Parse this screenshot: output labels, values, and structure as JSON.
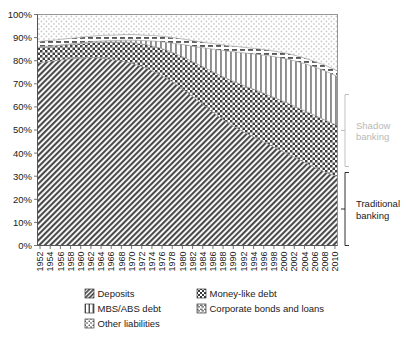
{
  "chart_data": {
    "type": "area",
    "title": "",
    "subtitle": "",
    "xlabel": "",
    "ylabel": "",
    "stacked": true,
    "normalized_percent": true,
    "grid": false,
    "legend_position": "bottom",
    "ylim": [
      0,
      100
    ],
    "ytick_labels": [
      "0%",
      "10%",
      "20%",
      "30%",
      "40%",
      "50%",
      "60%",
      "70%",
      "80%",
      "90%",
      "100%"
    ],
    "ytick_values": [
      0,
      10,
      20,
      30,
      40,
      50,
      60,
      70,
      80,
      90,
      100
    ],
    "xlim": [
      1952,
      2011
    ],
    "categories": [
      1952,
      1953,
      1954,
      1955,
      1956,
      1957,
      1958,
      1959,
      1960,
      1961,
      1962,
      1963,
      1964,
      1965,
      1966,
      1967,
      1968,
      1969,
      1970,
      1971,
      1972,
      1973,
      1974,
      1975,
      1976,
      1977,
      1978,
      1979,
      1980,
      1981,
      1982,
      1983,
      1984,
      1985,
      1986,
      1987,
      1988,
      1989,
      1990,
      1991,
      1992,
      1993,
      1994,
      1995,
      1996,
      1997,
      1998,
      1999,
      2000,
      2001,
      2002,
      2003,
      2004,
      2005,
      2006,
      2007,
      2008,
      2009,
      2010,
      2011
    ],
    "xtick_labels": [
      "1952",
      "1954",
      "1956",
      "1958",
      "1960",
      "1962",
      "1964",
      "1966",
      "1968",
      "1970",
      "1972",
      "1974",
      "1976",
      "1978",
      "1980",
      "1982",
      "1984",
      "1986",
      "1988",
      "1990",
      "1992",
      "1994",
      "1996",
      "1998",
      "2000",
      "2002",
      "2004",
      "2006",
      "2008",
      "2010"
    ],
    "series": [
      {
        "name": "Deposits",
        "pattern": "diagonal-hatch-dark",
        "color": "#5a5a5a",
        "values": [
          79.0,
          79.3,
          79.6,
          79.9,
          80.2,
          80.5,
          80.7,
          80.9,
          81.1,
          81.2,
          81.3,
          81.3,
          81.2,
          81.0,
          80.7,
          80.4,
          80.1,
          79.7,
          79.2,
          78.6,
          77.9,
          77.1,
          76.2,
          75.2,
          74.1,
          72.9,
          71.6,
          70.2,
          68.7,
          67.1,
          65.4,
          63.7,
          62.0,
          60.3,
          58.6,
          56.9,
          55.3,
          53.8,
          52.4,
          51.1,
          49.9,
          48.7,
          47.6,
          46.5,
          45.4,
          44.3,
          43.2,
          42.1,
          41.0,
          39.9,
          38.8,
          37.7,
          36.6,
          35.5,
          34.4,
          33.3,
          32.3,
          31.4,
          30.6,
          30.0
        ]
      },
      {
        "name": "Money-like debt",
        "pattern": "checker",
        "color": "#8a8a8a",
        "values": [
          6.6,
          6.6,
          6.5,
          6.4,
          6.3,
          6.2,
          6.2,
          6.2,
          6.2,
          6.3,
          6.4,
          6.6,
          6.8,
          7.1,
          7.4,
          7.7,
          8.0,
          8.4,
          8.8,
          9.2,
          9.6,
          10.0,
          10.5,
          11.0,
          11.5,
          12.0,
          12.5,
          13.0,
          13.6,
          14.2,
          14.8,
          15.4,
          16.0,
          16.6,
          17.2,
          17.8,
          18.3,
          18.8,
          19.2,
          19.6,
          19.9,
          20.2,
          20.5,
          20.8,
          21.0,
          21.2,
          21.4,
          21.6,
          21.8,
          22.0,
          22.1,
          22.2,
          22.3,
          22.4,
          22.5,
          22.6,
          22.6,
          22.5,
          22.3,
          22.0
        ]
      },
      {
        "name": "MBS/ABS debt",
        "pattern": "vertical-stripes",
        "color": "#9a9a9a",
        "values": [
          0.2,
          0.2,
          0.2,
          0.2,
          0.2,
          0.3,
          0.3,
          0.3,
          0.3,
          0.4,
          0.4,
          0.4,
          0.5,
          0.5,
          0.6,
          0.6,
          0.7,
          0.8,
          0.9,
          1.1,
          1.3,
          1.6,
          1.9,
          2.3,
          2.7,
          3.2,
          3.7,
          4.3,
          4.9,
          5.6,
          6.3,
          7.0,
          7.8,
          8.6,
          9.4,
          10.2,
          11.0,
          11.7,
          12.4,
          13.1,
          13.8,
          14.4,
          15.0,
          15.6,
          16.2,
          16.8,
          17.4,
          17.9,
          18.4,
          18.9,
          19.4,
          19.8,
          20.2,
          20.5,
          20.8,
          21.0,
          21.2,
          21.3,
          21.3,
          21.2
        ]
      },
      {
        "name": "Corporate bonds and loans",
        "pattern": "dashes",
        "color": "#707070",
        "values": [
          2.4,
          2.4,
          2.4,
          2.4,
          2.4,
          2.4,
          2.4,
          2.4,
          2.4,
          2.4,
          2.4,
          2.4,
          2.4,
          2.4,
          2.4,
          2.4,
          2.4,
          2.4,
          2.4,
          2.4,
          2.4,
          2.4,
          2.4,
          2.4,
          2.4,
          2.4,
          2.4,
          2.4,
          2.4,
          2.4,
          2.4,
          2.4,
          2.4,
          2.4,
          2.4,
          2.4,
          2.4,
          2.4,
          2.4,
          2.4,
          2.4,
          2.4,
          2.4,
          2.4,
          2.4,
          2.4,
          2.4,
          2.4,
          2.4,
          2.4,
          2.4,
          2.4,
          2.4,
          2.4,
          2.4,
          2.4,
          2.4,
          2.4,
          2.4,
          2.4
        ]
      },
      {
        "name": "Other liabilities",
        "pattern": "light-dots",
        "color": "#d8d8d8",
        "values": [
          11.8,
          11.5,
          11.3,
          11.1,
          10.9,
          10.6,
          10.4,
          10.2,
          10.0,
          9.7,
          9.5,
          9.3,
          9.1,
          9.0,
          8.9,
          8.9,
          8.8,
          8.7,
          8.7,
          8.7,
          8.8,
          8.9,
          9.0,
          9.1,
          9.3,
          9.5,
          9.8,
          10.1,
          10.4,
          10.7,
          11.1,
          11.5,
          11.8,
          12.1,
          12.4,
          12.7,
          13.0,
          13.3,
          13.6,
          13.8,
          14.0,
          14.3,
          14.5,
          14.7,
          15.0,
          15.3,
          15.6,
          16.0,
          16.4,
          16.8,
          17.3,
          17.9,
          18.5,
          19.2,
          19.9,
          20.7,
          21.5,
          22.4,
          23.4,
          24.4
        ]
      }
    ],
    "annotations": [
      {
        "name": "shadow-banking-bracket",
        "text": "Shadow\nbanking",
        "text_line1": "Shadow",
        "text_line2": "banking",
        "color": "#b9b9b9",
        "y_range_percent": [
          52,
          100
        ]
      },
      {
        "name": "traditional-banking-bracket",
        "text": "Traditional\nbanking",
        "text_line1": "Traditional",
        "text_line2": "banking",
        "color": "#1a1a1a",
        "y_range_percent": [
          0,
          30
        ]
      }
    ]
  },
  "legend": {
    "items": [
      {
        "label": "Deposits",
        "swatch": "diagonal-hatch-dark"
      },
      {
        "label": "Money-like debt",
        "swatch": "checker"
      },
      {
        "label": "MBS/ABS debt",
        "swatch": "vertical-stripes"
      },
      {
        "label": "Corporate bonds and loans",
        "swatch": "dashes"
      },
      {
        "label": "Other liabilities",
        "swatch": "light-dots"
      }
    ]
  }
}
